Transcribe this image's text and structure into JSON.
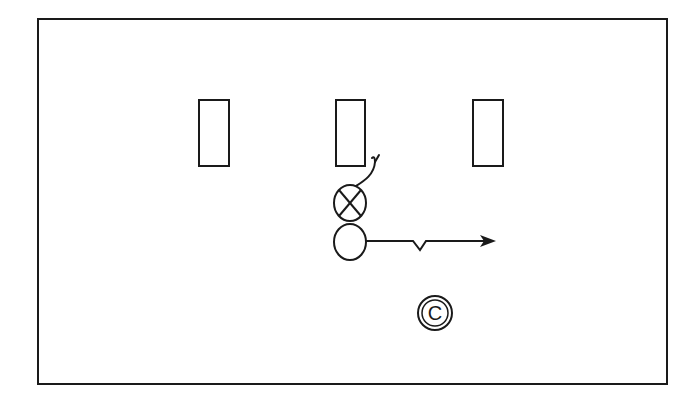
{
  "diagram": {
    "type": "play-diagram",
    "colors": {
      "background": "#ffffff",
      "stroke": "#1a1a1a"
    },
    "frame": {
      "x": 38,
      "y": 19,
      "width": 629,
      "height": 365
    },
    "blocking_dummies": [
      {
        "id": "left",
        "x": 199,
        "y": 100,
        "width": 30,
        "height": 66
      },
      {
        "id": "middle",
        "x": 336,
        "y": 100,
        "width": 29,
        "height": 66
      },
      {
        "id": "right",
        "x": 473,
        "y": 100,
        "width": 30,
        "height": 66
      }
    ],
    "players": [
      {
        "id": "defender-x",
        "symbol": "circle-x",
        "cx": 350,
        "cy": 203,
        "r": 16
      },
      {
        "id": "offense-o",
        "symbol": "circle",
        "cx": 350,
        "cy": 242,
        "r": 16
      },
      {
        "id": "coach",
        "symbol": "circle-c",
        "label": "C",
        "cx": 435,
        "cy": 313,
        "r": 17
      }
    ],
    "paths": [
      {
        "id": "defender-route",
        "from": "defender-x",
        "style": "curved-with-hook"
      },
      {
        "id": "offense-route",
        "from": "offense-o",
        "style": "straight-with-jog-and-arrow"
      }
    ]
  }
}
